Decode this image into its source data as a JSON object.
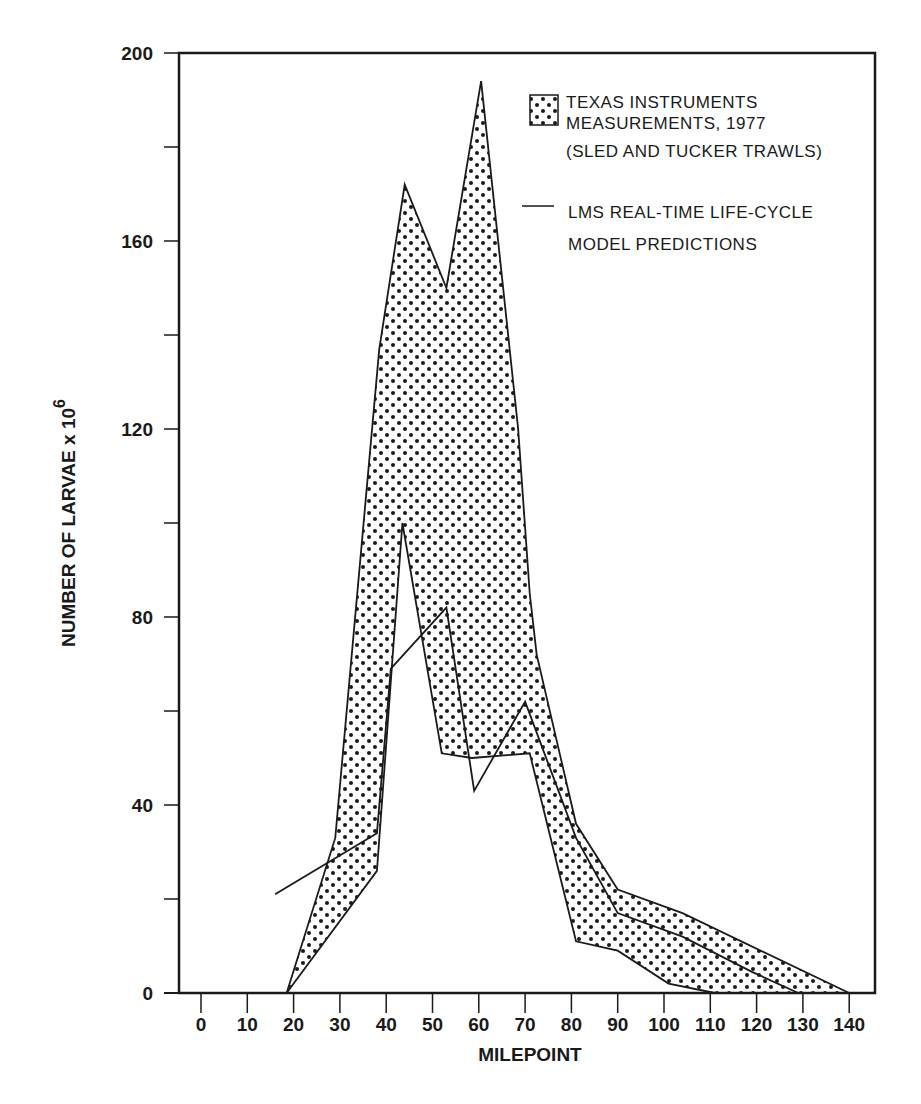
{
  "chart_data": {
    "type": "area",
    "title": "",
    "xlabel": "MILEPOINT",
    "ylabel": "NUMBER OF LARVAE x 10",
    "ylabel_superscript": "6",
    "xlim": [
      -5,
      145
    ],
    "ylim": [
      0,
      200
    ],
    "x_ticks": [
      0,
      10,
      20,
      30,
      40,
      50,
      60,
      70,
      80,
      90,
      100,
      110,
      120,
      130,
      140
    ],
    "y_ticks": [
      0,
      40,
      80,
      120,
      160,
      200
    ],
    "y_minor_ticks": [
      20,
      60,
      100,
      140,
      180
    ],
    "grid": false,
    "legend_position": "upper right",
    "legend": [
      {
        "kind": "dotted-band",
        "lines": [
          "TEXAS INSTRUMENTS",
          "MEASUREMENTS, 1977",
          "(SLED AND TUCKER TRAWLS)"
        ]
      },
      {
        "kind": "line",
        "lines": [
          "LMS REAL-TIME LIFE-CYCLE",
          "MODEL PREDICTIONS"
        ]
      }
    ],
    "series": [
      {
        "name": "Texas Instruments Measurements, 1977 (upper bound)",
        "role": "band-upper",
        "x": [
          18.5,
          29,
          38.5,
          44,
          53,
          60.5,
          68.5,
          71,
          72.5,
          81,
          90,
          104,
          140
        ],
        "y": [
          0,
          33,
          137,
          172,
          150,
          194,
          120,
          85,
          72,
          36,
          22,
          17,
          0
        ]
      },
      {
        "name": "Texas Instruments Measurements, 1977 (lower bound)",
        "role": "band-lower",
        "x": [
          18.5,
          38,
          43.5,
          52,
          58.5,
          71,
          81,
          90,
          101,
          111
        ],
        "y": [
          0,
          26,
          100,
          51,
          50,
          51,
          11,
          9,
          2,
          0
        ]
      },
      {
        "name": "LMS Real-Time Life-Cycle Model Predictions",
        "role": "line",
        "x": [
          16,
          38,
          41,
          53,
          59,
          70,
          81,
          90,
          104,
          119,
          129
        ],
        "y": [
          21,
          34,
          69,
          82,
          43,
          62,
          33,
          17,
          12,
          4.5,
          0
        ]
      }
    ]
  }
}
